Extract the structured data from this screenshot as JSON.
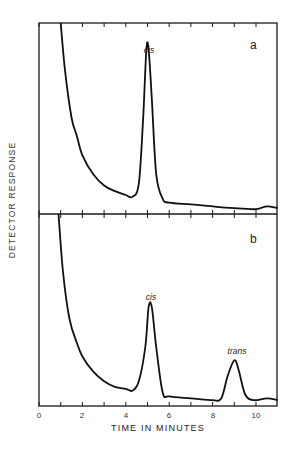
{
  "figure": {
    "ylabel": "DETECTOR   RESPONSE",
    "xlabel": "TIME  IN  MINUTES",
    "x_tick_labels": [
      "0",
      "2",
      "4",
      "6",
      "8",
      "10"
    ],
    "panels": [
      {
        "letter": "a",
        "peaks": [
          {
            "label": "cis",
            "time_min": 5.0
          }
        ]
      },
      {
        "letter": "b",
        "peaks": [
          {
            "label": "cis",
            "time_min": 5.1
          },
          {
            "label": "trans",
            "time_min": 9.0
          }
        ]
      }
    ]
  },
  "chart_data": [
    {
      "type": "line",
      "title": "a",
      "xlabel": "TIME IN MINUTES",
      "ylabel": "DETECTOR RESPONSE",
      "xlim": [
        0,
        11
      ],
      "ylim": [
        0,
        100
      ],
      "grid": false,
      "x_ticks": [
        0,
        1,
        2,
        3,
        4,
        5,
        6,
        7,
        8,
        9,
        10
      ],
      "annotations": [
        {
          "text": "cis",
          "x": 5.0
        },
        {
          "text": "a",
          "position": "top-right"
        }
      ],
      "series": [
        {
          "name": "chromatogram a",
          "x": [
            1.0,
            1.2,
            1.5,
            1.75,
            2.0,
            2.5,
            3.0,
            3.5,
            4.0,
            4.3,
            4.6,
            4.8,
            4.95,
            5.05,
            5.2,
            5.4,
            5.7,
            6.0,
            7.0,
            8.0,
            9.0,
            10.0,
            10.5,
            11.0
          ],
          "y": [
            100,
            75,
            50,
            40,
            30,
            20,
            14,
            11,
            9,
            8,
            15,
            50,
            86,
            86,
            60,
            20,
            7,
            5,
            4,
            3,
            2,
            1.5,
            3,
            2
          ]
        }
      ]
    },
    {
      "type": "line",
      "title": "b",
      "xlabel": "TIME IN MINUTES",
      "ylabel": "DETECTOR RESPONSE",
      "xlim": [
        0,
        11
      ],
      "ylim": [
        0,
        100
      ],
      "grid": false,
      "x_ticks": [
        0,
        1,
        2,
        3,
        4,
        5,
        6,
        7,
        8,
        9,
        10
      ],
      "annotations": [
        {
          "text": "cis",
          "x": 5.1
        },
        {
          "text": "trans",
          "x": 9.0
        },
        {
          "text": "b",
          "position": "top-right"
        }
      ],
      "series": [
        {
          "name": "chromatogram b",
          "x": [
            0.9,
            1.1,
            1.4,
            1.75,
            2.0,
            2.5,
            3.0,
            3.5,
            4.0,
            4.3,
            4.6,
            4.9,
            5.05,
            5.2,
            5.4,
            5.7,
            6.0,
            7.0,
            8.0,
            8.4,
            8.7,
            9.0,
            9.2,
            9.5,
            9.9,
            10.5,
            11.0
          ],
          "y": [
            100,
            70,
            45,
            32,
            25,
            17,
            12,
            9,
            8,
            7,
            12,
            30,
            51,
            51,
            30,
            6,
            4,
            3,
            2,
            3,
            15,
            23,
            18,
            5,
            2,
            3,
            2
          ]
        }
      ]
    }
  ]
}
